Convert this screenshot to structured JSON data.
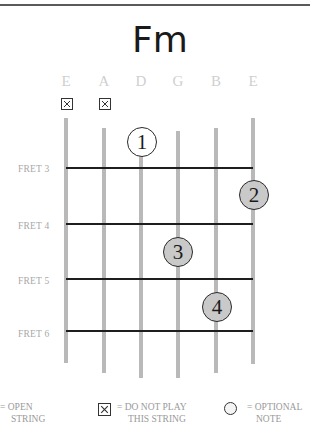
{
  "chord": {
    "name": "Fm"
  },
  "strings": [
    {
      "label": "E",
      "x": 66,
      "top": 118,
      "bottom": 363,
      "muted": true
    },
    {
      "label": "A",
      "x": 104,
      "top": 128,
      "bottom": 373,
      "muted": true
    },
    {
      "label": "D",
      "x": 141,
      "top": 150,
      "bottom": 378,
      "muted": false
    },
    {
      "label": "G",
      "x": 178,
      "top": 131,
      "bottom": 378,
      "muted": false
    },
    {
      "label": "B",
      "x": 216,
      "top": 128,
      "bottom": 373,
      "muted": false
    },
    {
      "label": "E",
      "x": 253,
      "top": 118,
      "bottom": 364,
      "muted": false
    }
  ],
  "frets": [
    {
      "label": "FRET 3",
      "y": 168
    },
    {
      "label": "FRET 4",
      "y": 224
    },
    {
      "label": "FRET 5",
      "y": 279
    },
    {
      "label": "FRET 6",
      "y": 331
    }
  ],
  "fingers": [
    {
      "number": "1",
      "string": "D",
      "x": 142,
      "y": 142,
      "fill": "#ffffff"
    },
    {
      "number": "2",
      "string": "E",
      "x": 254,
      "y": 195,
      "fill": "#c9c9c9"
    },
    {
      "number": "3",
      "string": "G",
      "x": 178,
      "y": 252,
      "fill": "#c9c9c9"
    },
    {
      "number": "4",
      "string": "B",
      "x": 217,
      "y": 307,
      "fill": "#c9c9c9"
    }
  ],
  "legend": {
    "open": {
      "line1": "= OPEN",
      "line2": "STRING"
    },
    "mute": {
      "line1": "= DO NOT PLAY",
      "line2": "THIS STRING"
    },
    "optional": {
      "line1": "= OPTIONAL",
      "line2": "NOTE"
    }
  },
  "colors": {
    "string": "#b9b9b9",
    "fret": "#1e1e1e",
    "finger_fill": "#c9c9c9",
    "label_grey": "#cfcfcf",
    "text_grey": "#9a9a9a"
  }
}
